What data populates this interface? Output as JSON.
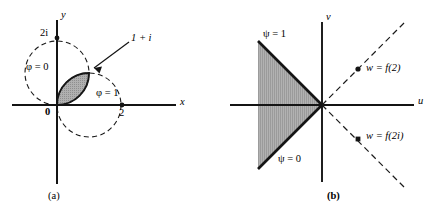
{
  "figure": {
    "panels": [
      {
        "id": "a",
        "caption": "(a)",
        "axes": {
          "x_label": "x",
          "y_label": "y"
        },
        "tick_labels": [
          {
            "name": "origin",
            "text": "0"
          },
          {
            "name": "two-i",
            "text": "2i"
          },
          {
            "name": "two",
            "text": "2"
          }
        ],
        "annotations": [
          {
            "name": "phi-zero",
            "text": "φ = 0"
          },
          {
            "name": "phi-one",
            "text": "φ = 1"
          },
          {
            "name": "one-plus-i",
            "text": "1 + i"
          }
        ],
        "geometry": {
          "circle_left": {
            "center": [
              0,
              1
            ],
            "radius": 1,
            "style": "dashed"
          },
          "circle_right": {
            "center": [
              1,
              0
            ],
            "radius": 1,
            "style": "dashed"
          },
          "intersections": [
            [
              0,
              0
            ],
            [
              1,
              1
            ]
          ],
          "shaded_region": "lens"
        }
      },
      {
        "id": "b",
        "caption": "(b)",
        "axes": {
          "x_label": "u",
          "y_label": "v"
        },
        "annotations": [
          {
            "name": "psi-one",
            "text": "ψ = 1"
          },
          {
            "name": "psi-zero",
            "text": "ψ = 0"
          },
          {
            "name": "w-f-2",
            "text": "w = f(2)"
          },
          {
            "name": "w-f-2i",
            "text": "w = f(2i)"
          }
        ],
        "geometry": {
          "wedge": {
            "vertex": [
              0,
              0
            ],
            "opens": "left",
            "half_angle_deg": 45
          },
          "dashed_rays": [
            "up-right-45",
            "down-right-45"
          ],
          "points": [
            {
              "name": "w-f-2",
              "on_ray": "up-right-45"
            },
            {
              "name": "w-f-2i",
              "on_ray": "down-right-45"
            }
          ]
        }
      }
    ],
    "colors": {
      "stroke": "#1a1a1a",
      "shade_fill": "#a8a8a8",
      "background": "#ffffff"
    }
  }
}
